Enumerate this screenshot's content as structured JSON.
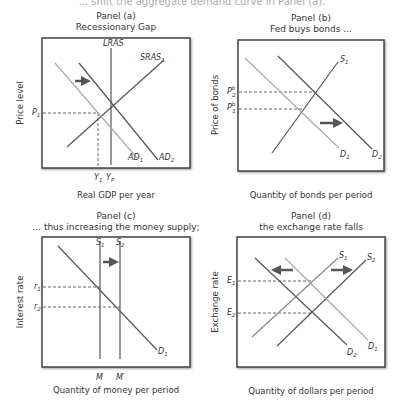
{
  "caption": "... shift the aggregate demand curve in Panel (a).",
  "colors": {
    "dark_line": "#555555",
    "mid_line": "#888888",
    "light_line": "#aaaaaa",
    "frame": "#444444",
    "dashed": "#555555"
  },
  "panels": [
    {
      "id": "a",
      "title": "Panel (a)",
      "subtitle": "Recessionary Gap",
      "ylabel": "Price level",
      "xlabel": "Real GDP per year",
      "curves": [
        "LRAS",
        "SRAS1",
        "AD1",
        "AD2"
      ],
      "labels": {
        "lras": "LRAS",
        "sras": "SRAS",
        "sras_sub": "1",
        "ad1": "AD",
        "ad1_sub": "1",
        "ad2": "AD",
        "ad2_sub": "2",
        "p1": "P",
        "p1_sub": "1",
        "y1": "Y",
        "y1_sub": "1",
        "yp": "Y",
        "yp_sub": "P"
      },
      "arrow": "right"
    },
    {
      "id": "b",
      "title": "Panel (b)",
      "subtitle": "Fed buys bonds ...",
      "ylabel": "Price of bonds",
      "xlabel": "Quantity of bonds per period",
      "labels": {
        "s1": "S",
        "s1_sub": "1",
        "d1": "D",
        "d1_sub": "1",
        "d2": "D",
        "d2_sub": "2",
        "pb2": "P",
        "pb2_sup": "b",
        "pb2_sub": "2",
        "pb1": "P",
        "pb1_sup": "b",
        "pb1_sub": "1"
      },
      "arrow": "right"
    },
    {
      "id": "c",
      "title": "Panel (c)",
      "subtitle": "... thus increasing the money supply;",
      "ylabel": "Interest rate",
      "xlabel": "Quantity of money per period",
      "labels": {
        "s1": "S",
        "s1_sub": "1",
        "s2": "S",
        "s2_sub": "2",
        "d1": "D",
        "d1_sub": "1",
        "r1": "r",
        "r1_sub": "1",
        "r2": "r",
        "r2_sub": "2",
        "m": "M",
        "mprime": "M′"
      },
      "arrow": "right"
    },
    {
      "id": "d",
      "title": "Panel (d)",
      "subtitle": "the exchange rate falls",
      "ylabel": "Exchange rate",
      "xlabel": "Quantity of dollars per period",
      "labels": {
        "s1": "S",
        "s1_sub": "1",
        "s2": "S",
        "s2_sub": "2",
        "d1": "D",
        "d1_sub": "1",
        "d2": "D",
        "d2_sub": "2",
        "e1": "E",
        "e1_sub": "1",
        "e2": "E",
        "e2_sub": "2"
      },
      "arrows": [
        "left",
        "right"
      ]
    }
  ]
}
